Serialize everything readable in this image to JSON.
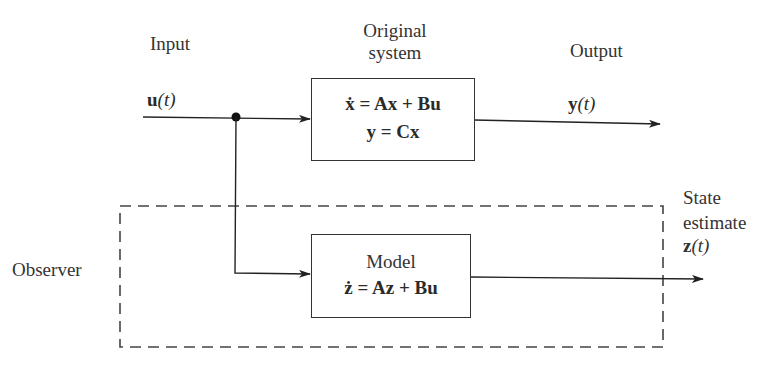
{
  "diagram": {
    "type": "block-diagram",
    "labels": {
      "input": "Input",
      "original_system_line1": "Original",
      "original_system_line2": "system",
      "output": "Output",
      "state_estimate_line1": "State",
      "state_estimate_line2": "estimate",
      "observer": "Observer",
      "model": "Model"
    },
    "signals": {
      "input_vec": "u",
      "output_vec": "y",
      "estimate_vec": "z",
      "time_arg": "(t)"
    },
    "original_system": {
      "eq1": {
        "lhs": "ẋ",
        "rhs": " = Ax + Bu"
      },
      "eq2": "y = Cx"
    },
    "model_block": {
      "eq": {
        "lhs": "ż",
        "rhs": " = Az + Bu"
      }
    },
    "nodes": [
      {
        "id": "input",
        "label": "u(t)"
      },
      {
        "id": "original-system",
        "label": "ẋ = Ax + Bu; y = Cx"
      },
      {
        "id": "model",
        "label": "ż = Az + Bu"
      },
      {
        "id": "output",
        "label": "y(t)"
      },
      {
        "id": "state-estimate",
        "label": "z(t)"
      }
    ],
    "edges": [
      {
        "from": "input",
        "to": "original-system"
      },
      {
        "from": "input",
        "to": "model",
        "via": "junction"
      },
      {
        "from": "original-system",
        "to": "output"
      },
      {
        "from": "model",
        "to": "state-estimate"
      }
    ],
    "groups": [
      {
        "id": "observer",
        "label": "Observer",
        "contains": [
          "model"
        ],
        "style": "dashed"
      }
    ]
  }
}
